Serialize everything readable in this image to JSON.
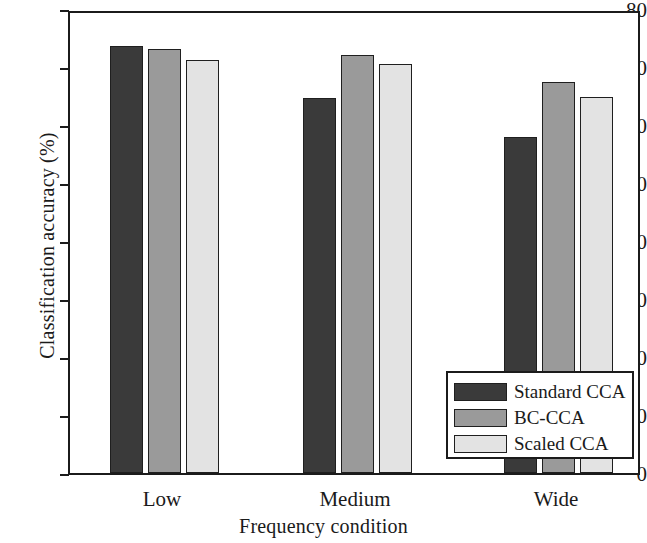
{
  "chart_data": {
    "type": "bar",
    "title": "",
    "xlabel": "Frequency condition",
    "ylabel": "Classification accuracy (%)",
    "categories": [
      "Low",
      "Medium",
      "Wide"
    ],
    "series": [
      {
        "name": "Standard CCA",
        "values": [
          73.6,
          64.7,
          58.0
        ],
        "color": "#3a3a3a"
      },
      {
        "name": "BC-CCA",
        "values": [
          73.1,
          72.0,
          67.5
        ],
        "color": "#9a9a9a"
      },
      {
        "name": "Scaled CCA",
        "values": [
          71.2,
          70.5,
          64.8
        ],
        "color": "#e3e3e3"
      }
    ],
    "ylim": [
      0,
      80
    ],
    "yticks": [
      0,
      10,
      20,
      30,
      40,
      50,
      60,
      70,
      80
    ],
    "ytick_labels": [
      "0",
      "10",
      "20",
      "30",
      "40",
      "50",
      "60",
      "70",
      "80"
    ],
    "grid": false,
    "legend_position": "lower right",
    "axis_color": "#1b1b1b",
    "bar_edge_color": "#1f1f1f",
    "background": "#ffffff"
  },
  "legend": {
    "items": [
      {
        "label": "Standard CCA",
        "color": "#3a3a3a"
      },
      {
        "label": "BC-CCA",
        "color": "#9a9a9a"
      },
      {
        "label": "Scaled CCA",
        "color": "#e3e3e3"
      }
    ]
  }
}
